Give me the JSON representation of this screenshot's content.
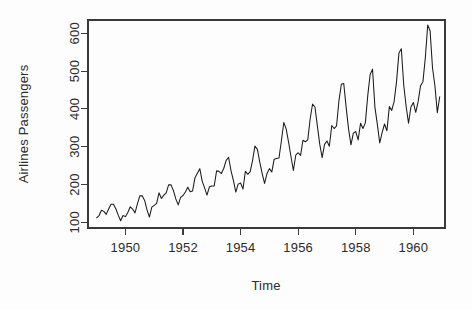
{
  "chart_data": {
    "type": "line",
    "title": "",
    "xlabel": "Time",
    "ylabel": "Airlines Passengers",
    "xlim": [
      1948.7,
      1961.1
    ],
    "ylim": [
      85,
      635
    ],
    "grid": false,
    "legend": null,
    "x_ticks": [
      1950,
      1952,
      1954,
      1956,
      1958,
      1960
    ],
    "x_tick_labels": [
      "1950",
      "1952",
      "1954",
      "1956",
      "1958",
      "1960"
    ],
    "y_ticks": [
      100,
      200,
      300,
      400,
      500,
      600
    ],
    "y_tick_labels": [
      "100",
      "200",
      "300",
      "400",
      "500",
      "600"
    ],
    "series": [
      {
        "name": "AirPassengers",
        "color": "#1b1b1b",
        "x_start": 1949.0,
        "x_step": 0.0833333,
        "values": [
          112,
          118,
          132,
          129,
          121,
          135,
          148,
          148,
          136,
          119,
          104,
          118,
          115,
          126,
          141,
          135,
          125,
          149,
          170,
          170,
          158,
          133,
          114,
          140,
          145,
          150,
          178,
          163,
          172,
          178,
          199,
          199,
          184,
          162,
          146,
          166,
          171,
          180,
          193,
          181,
          183,
          218,
          230,
          242,
          209,
          191,
          172,
          194,
          196,
          196,
          236,
          235,
          229,
          243,
          264,
          272,
          237,
          211,
          180,
          201,
          204,
          188,
          235,
          227,
          234,
          264,
          302,
          293,
          259,
          229,
          203,
          229,
          242,
          233,
          267,
          269,
          270,
          315,
          364,
          347,
          312,
          274,
          237,
          278,
          284,
          277,
          317,
          313,
          318,
          374,
          413,
          405,
          355,
          306,
          271,
          306,
          315,
          301,
          356,
          348,
          355,
          422,
          465,
          467,
          404,
          347,
          305,
          336,
          340,
          318,
          362,
          348,
          363,
          435,
          491,
          505,
          404,
          359,
          310,
          337,
          360,
          342,
          406,
          396,
          420,
          472,
          548,
          559,
          463,
          407,
          362,
          405,
          417,
          391,
          419,
          461,
          472,
          535,
          622,
          606,
          508,
          461,
          390,
          432
        ]
      }
    ]
  },
  "plot_box": {
    "left": 88,
    "top": 20,
    "right": 445,
    "bottom": 228
  },
  "style": {
    "background": "#fdfdfd",
    "axis_color": "#3a3a3a",
    "text_color": "#2b2b2b",
    "line_color": "#1b1b1b"
  }
}
